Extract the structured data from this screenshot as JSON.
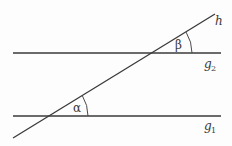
{
  "diagram": {
    "type": "geometry",
    "colors": {
      "stroke": "#3a3a3a",
      "background": "#fdfdfd"
    },
    "lines": {
      "g1": {
        "label": "g",
        "subscript": "1",
        "x1": 13,
        "y1": 116,
        "x2": 221,
        "y2": 116
      },
      "g2": {
        "label": "g",
        "subscript": "2",
        "x1": 13,
        "y1": 53,
        "x2": 221,
        "y2": 53
      },
      "h": {
        "label": "h",
        "x1": 13,
        "y1": 138,
        "x2": 215,
        "y2": 14
      }
    },
    "angles": {
      "alpha": {
        "symbol": "α",
        "vertex": [
          49,
          116
        ],
        "radius": 39
      },
      "beta": {
        "symbol": "β",
        "vertex": [
          152,
          53
        ],
        "radius": 40
      }
    }
  }
}
